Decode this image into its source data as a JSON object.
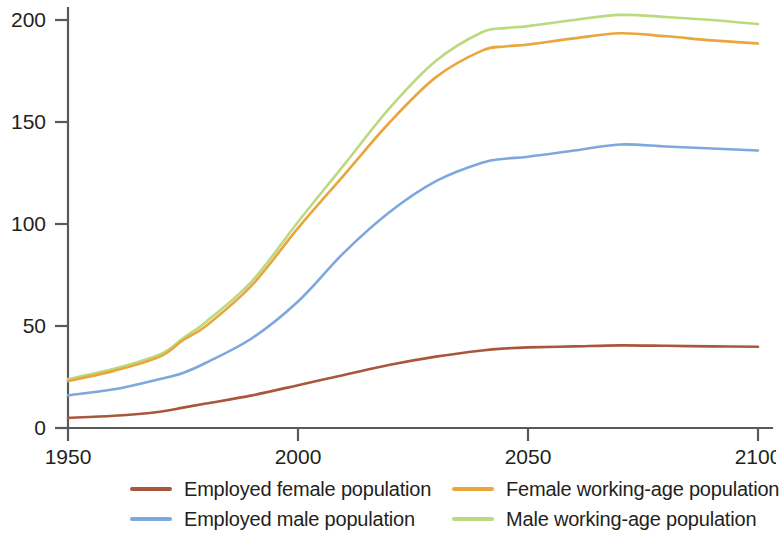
{
  "chart_data": {
    "type": "line",
    "title": "",
    "xlabel": "",
    "ylabel": "",
    "xlim": [
      1950,
      2100
    ],
    "ylim": [
      0,
      210
    ],
    "xticks": [
      1950,
      2000,
      2050,
      2100
    ],
    "yticks": [
      0,
      50,
      100,
      150,
      200
    ],
    "xtick_labels": [
      "1950",
      "2000",
      "2050",
      "2100"
    ],
    "ytick_labels": [
      "0",
      "50",
      "100",
      "150",
      "200"
    ],
    "grid": false,
    "legend_position": "bottom",
    "x": [
      1950,
      1960,
      1970,
      1975,
      1980,
      1990,
      2000,
      2010,
      2020,
      2030,
      2040,
      2045,
      2050,
      2060,
      2070,
      2080,
      2090,
      2100
    ],
    "series": [
      {
        "name": "Employed female population",
        "color": "#a9573c",
        "values": [
          5,
          6,
          8,
          10,
          12,
          16,
          21,
          26,
          31,
          35,
          38,
          39,
          39.5,
          40,
          40.5,
          40.3,
          40,
          39.8
        ]
      },
      {
        "name": "Employed male population",
        "color": "#7ea8dd",
        "values": [
          16,
          19,
          24,
          27,
          32,
          44,
          62,
          86,
          106,
          121,
          130,
          132,
          133,
          136,
          139,
          138,
          137,
          136
        ]
      },
      {
        "name": "Female working-age population",
        "color": "#e9a63c",
        "values": [
          23,
          28,
          35,
          43,
          50,
          70,
          98,
          124,
          150,
          172,
          185,
          187,
          188,
          191,
          193.5,
          192,
          190,
          188.5
        ]
      },
      {
        "name": "Male working-age population",
        "color": "#bcd97f",
        "values": [
          24,
          29,
          36,
          44,
          52,
          72,
          101,
          129,
          157,
          180,
          194,
          196,
          197,
          200,
          202.5,
          201.5,
          200,
          198
        ]
      }
    ]
  },
  "legend": {
    "entries": [
      {
        "label": "Employed female population",
        "color": "#a9573c"
      },
      {
        "label": "Female working-age population",
        "color": "#e9a63c"
      },
      {
        "label": "Employed male population",
        "color": "#7ea8dd"
      },
      {
        "label": "Male working-age population",
        "color": "#bcd97f"
      }
    ]
  }
}
